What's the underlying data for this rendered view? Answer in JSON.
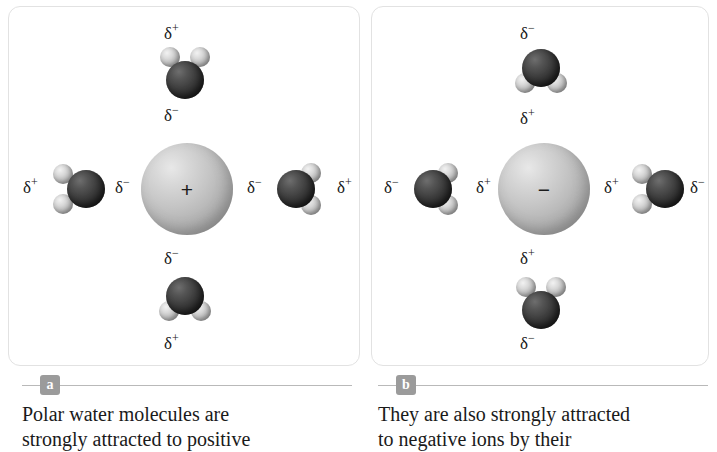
{
  "figure": {
    "type": "science-diagram",
    "panels": [
      {
        "key": "a",
        "badge": "a",
        "ion": {
          "name": "positive-ion",
          "sign": "+",
          "label": "cation"
        },
        "caption_lines": [
          "Polar water molecules are",
          "strongly attracted to positive"
        ],
        "waters": [
          {
            "position": "top",
            "orientation": "hydrogens-up",
            "label_outer": {
              "text": "δ",
              "sup": "+"
            },
            "label_inner": {
              "text": "δ",
              "sup": "−"
            }
          },
          {
            "position": "left",
            "orientation": "hydrogens-left",
            "label_outer": {
              "text": "δ",
              "sup": "+"
            },
            "label_inner": {
              "text": "δ",
              "sup": "−"
            }
          },
          {
            "position": "right",
            "orientation": "hydrogens-right",
            "label_outer": {
              "text": "δ",
              "sup": "+"
            },
            "label_inner": {
              "text": "δ",
              "sup": "−"
            }
          },
          {
            "position": "bottom",
            "orientation": "hydrogens-down",
            "label_outer": {
              "text": "δ",
              "sup": "+"
            },
            "label_inner": {
              "text": "δ",
              "sup": "−"
            }
          }
        ]
      },
      {
        "key": "b",
        "badge": "b",
        "ion": {
          "name": "negative-ion",
          "sign": "−",
          "label": "anion"
        },
        "caption_lines": [
          "They are also strongly attracted",
          "to negative ions by their"
        ],
        "waters": [
          {
            "position": "top",
            "orientation": "hydrogens-down",
            "label_outer": {
              "text": "δ",
              "sup": "−"
            },
            "label_inner": {
              "text": "δ",
              "sup": "+"
            }
          },
          {
            "position": "left",
            "orientation": "hydrogens-right",
            "label_outer": {
              "text": "δ",
              "sup": "−"
            },
            "label_inner": {
              "text": "δ",
              "sup": "+"
            }
          },
          {
            "position": "right",
            "orientation": "hydrogens-left",
            "label_outer": {
              "text": "δ",
              "sup": "−"
            },
            "label_inner": {
              "text": "δ",
              "sup": "+"
            }
          },
          {
            "position": "bottom",
            "orientation": "hydrogens-up",
            "label_outer": {
              "text": "δ",
              "sup": "−"
            },
            "label_inner": {
              "text": "δ",
              "sup": "+"
            }
          }
        ]
      }
    ]
  },
  "panel_a": {
    "badge": "a",
    "ion_sign": "+",
    "top_outer": "δ",
    "top_outer_sup": "+",
    "top_inner": "δ",
    "top_inner_sup": "−",
    "left_outer": "δ",
    "left_outer_sup": "+",
    "left_inner": "δ",
    "left_inner_sup": "−",
    "right_inner": "δ",
    "right_inner_sup": "−",
    "right_outer": "δ",
    "right_outer_sup": "+",
    "bottom_inner": "δ",
    "bottom_inner_sup": "−",
    "bottom_outer": "δ",
    "bottom_outer_sup": "+",
    "caption_line1": "Polar water molecules are",
    "caption_line2": "strongly attracted to positive"
  },
  "panel_b": {
    "badge": "b",
    "ion_sign": "−",
    "top_outer": "δ",
    "top_outer_sup": "−",
    "top_inner": "δ",
    "top_inner_sup": "+",
    "left_outer": "δ",
    "left_outer_sup": "−",
    "left_inner": "δ",
    "left_inner_sup": "+",
    "right_inner": "δ",
    "right_inner_sup": "+",
    "right_outer": "δ",
    "right_outer_sup": "−",
    "bottom_inner": "δ",
    "bottom_inner_sup": "+",
    "bottom_outer": "δ",
    "bottom_outer_sup": "−",
    "caption_line1": "They are also strongly attracted",
    "caption_line2": "to negative ions by their"
  },
  "colors": {
    "oxygen": "#2e2e2e",
    "hydrogen": "#d2d2d2",
    "ion_sphere": "#c2c2c2",
    "panel_border": "#e2e2e2",
    "badge_bg": "#9b9b9b",
    "rule": "#b9b9b9",
    "text": "#1a1a1a",
    "background": "#ffffff"
  }
}
